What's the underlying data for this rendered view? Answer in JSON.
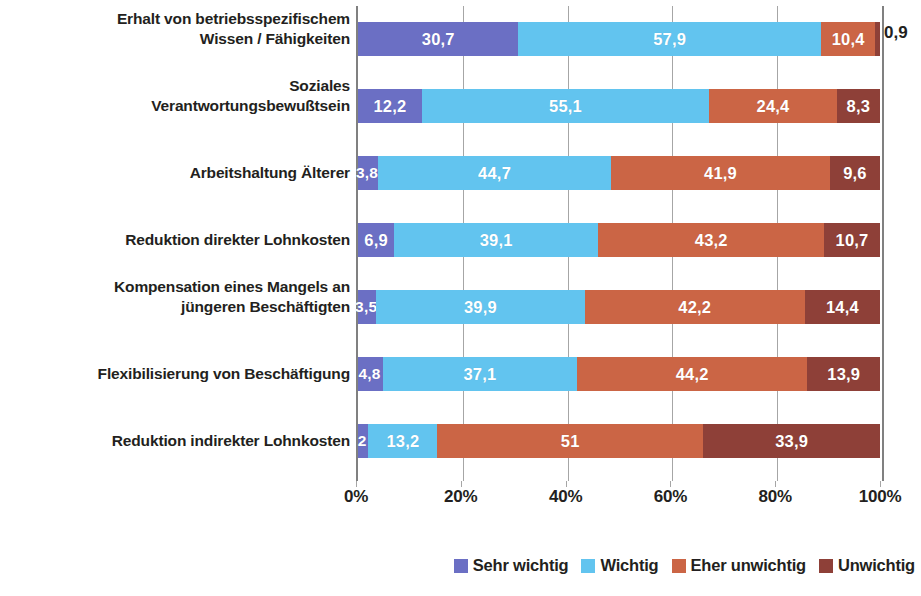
{
  "chart_data": {
    "type": "bar",
    "subtype": "stacked-horizontal-100",
    "title": "",
    "subtitle": "",
    "xlabel": "",
    "ylabel": "",
    "xlim": [
      0,
      100
    ],
    "xticks": [
      "0%",
      "20%",
      "40%",
      "60%",
      "80%",
      "100%"
    ],
    "xtick_values": [
      0,
      20,
      40,
      60,
      80,
      100
    ],
    "grid": true,
    "legend_position": "bottom-right",
    "categories": [
      "Erhalt von betriebsspezifischem Wissen / Fähigkeiten",
      "Soziales Verantwortungsbewußtsein",
      "Arbeitshaltung Älterer",
      "Reduktion direkter Lohnkosten",
      "Kompensation eines Mangels an jüngeren Beschäftigten",
      "Flexibilisierung von Beschäftigung",
      "Reduktion indirekter Lohnkosten"
    ],
    "category_lines": [
      [
        "Erhalt von betriebsspezifischem",
        "Wissen / Fähigkeiten"
      ],
      [
        "Soziales",
        "Verantwortungsbewußtsein"
      ],
      [
        "Arbeitshaltung Älterer"
      ],
      [
        "Reduktion direkter Lohnkosten"
      ],
      [
        "Kompensation eines Mangels an",
        "jüngeren Beschäftigten"
      ],
      [
        "Flexibilisierung von Beschäftigung"
      ],
      [
        "Reduktion indirekter Lohnkosten"
      ]
    ],
    "series": [
      {
        "name": "Sehr wichtig",
        "color": "#6b6fc4",
        "values": [
          30.7,
          12.2,
          3.8,
          6.9,
          3.5,
          4.8,
          2.0
        ]
      },
      {
        "name": "Wichtig",
        "color": "#62c4ef",
        "values": [
          57.9,
          55.1,
          44.7,
          39.1,
          39.9,
          37.1,
          13.2
        ]
      },
      {
        "name": "Eher unwichtig",
        "color": "#cb6545",
        "values": [
          10.4,
          24.4,
          41.9,
          43.2,
          42.2,
          44.2,
          51.0
        ]
      },
      {
        "name": "Unwichtig",
        "color": "#8e4038",
        "values": [
          0.9,
          8.3,
          9.6,
          10.7,
          14.4,
          13.9,
          33.9
        ]
      }
    ],
    "data_labels": [
      [
        "30,7",
        "57,9",
        "10,4",
        "0,9"
      ],
      [
        "12,2",
        "55,1",
        "24,4",
        "8,3"
      ],
      [
        "3,8",
        "44,7",
        "41,9",
        "9,6"
      ],
      [
        "6,9",
        "39,1",
        "43,2",
        "10,7"
      ],
      [
        "3,5",
        "39,9",
        "42,2",
        "14,4"
      ],
      [
        "4,8",
        "37,1",
        "44,2",
        "13,9"
      ],
      [
        "2",
        "13,2",
        "51",
        "33,9"
      ]
    ],
    "label_outside": [
      [
        false,
        false,
        false,
        true
      ],
      [
        false,
        false,
        false,
        false
      ],
      [
        false,
        false,
        false,
        false
      ],
      [
        false,
        false,
        false,
        false
      ],
      [
        false,
        false,
        false,
        false
      ],
      [
        false,
        false,
        false,
        false
      ],
      [
        false,
        false,
        false,
        false
      ]
    ],
    "legend": [
      {
        "label": "Sehr wichtig",
        "color": "#6b6fc4"
      },
      {
        "label": "Wichtig",
        "color": "#62c4ef"
      },
      {
        "label": "Eher unwichtig",
        "color": "#cb6545"
      },
      {
        "label": "Unwichtig",
        "color": "#8e4038"
      }
    ],
    "colors": {
      "sehr_wichtig": "#6b6fc4",
      "wichtig": "#62c4ef",
      "eher_unwichtig": "#cb6545",
      "unwichtig": "#8e4038",
      "gridline": "#a6a6a6",
      "axis": "#808080",
      "text": "#231f20"
    }
  }
}
